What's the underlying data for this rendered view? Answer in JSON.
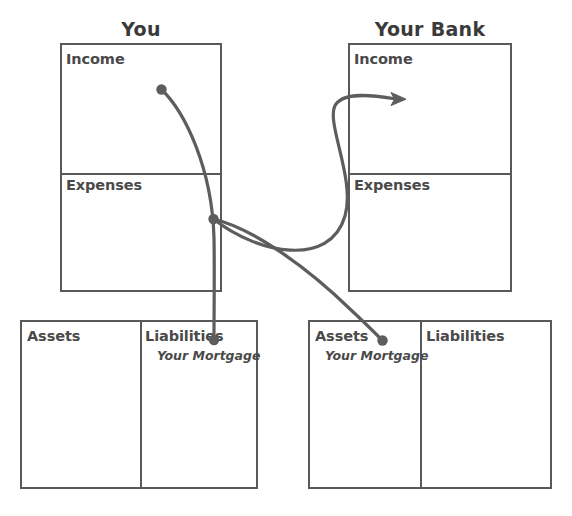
{
  "diagram": {
    "title_left": "You",
    "title_right": "Your Bank",
    "panels": [
      {
        "id": "you-statement",
        "title": "You",
        "rows": [
          {
            "label": "Income"
          },
          {
            "label": "Expenses"
          }
        ]
      },
      {
        "id": "bank-statement",
        "title": "Your Bank",
        "rows": [
          {
            "label": "Income"
          },
          {
            "label": "Expenses"
          }
        ]
      }
    ],
    "balance_sheets": [
      {
        "id": "you-balance-sheet",
        "columns": [
          {
            "label": "Assets",
            "entries": []
          },
          {
            "label": "Liabilities",
            "entries": [
              "Your Mortgage"
            ]
          }
        ]
      },
      {
        "id": "bank-balance-sheet",
        "columns": [
          {
            "label": "Assets",
            "entries": [
              "Your Mortgage"
            ]
          },
          {
            "label": "Liabilities",
            "entries": []
          }
        ]
      }
    ],
    "flows": [
      {
        "name": "income-to-liability",
        "from": "you-income",
        "to": "you-liabilities-mortgage",
        "has_arrow": false
      },
      {
        "name": "expense-to-bank-income",
        "from": "you-expenses",
        "to": "bank-income",
        "has_arrow": true
      },
      {
        "name": "expense-to-bank-asset",
        "from": "you-expenses",
        "to": "bank-assets-mortgage",
        "has_arrow": false
      }
    ],
    "colors": {
      "stroke": "#595959",
      "flow": "#5d5d5d",
      "text": "#4a4a4a",
      "background": "#ffffff"
    }
  }
}
